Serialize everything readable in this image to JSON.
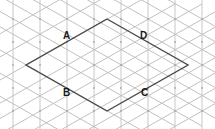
{
  "figure": {
    "title": "",
    "type": "geometry-diagram",
    "canvas": {
      "width": 215,
      "height": 129
    },
    "background_color": "#ffffff",
    "grid": {
      "kind": "triangular-isometric-grid",
      "vertical_line_color": "#c8c8c8",
      "diagonal_line_color": "#c0c0c0",
      "node_dot_color": "#a8a8a8",
      "vertical_spacing_px": 27,
      "row_spacing_px": 23,
      "vertical_x_positions": [
        13,
        40,
        67,
        94,
        121,
        148,
        175,
        202
      ],
      "row_y_positions": [
        -4,
        19,
        42,
        65,
        88,
        111,
        134
      ]
    },
    "shape": {
      "name": "rhombus",
      "stroke_color": "#4a4a4a",
      "stroke_width_px": 1.4,
      "fill": "none",
      "vertices": [
        {
          "id": "top",
          "x": 107,
          "y": 19
        },
        {
          "id": "right",
          "x": 188,
          "y": 65
        },
        {
          "id": "bottom",
          "x": 107,
          "y": 111
        },
        {
          "id": "left",
          "x": 26,
          "y": 65
        }
      ]
    },
    "labels": [
      {
        "id": "A",
        "text": "A",
        "x": 63,
        "y": 31,
        "edge": "top-left"
      },
      {
        "id": "D",
        "text": "D",
        "x": 140,
        "y": 31,
        "edge": "top-right"
      },
      {
        "id": "B",
        "text": "B",
        "x": 63,
        "y": 88,
        "edge": "bottom-left"
      },
      {
        "id": "C",
        "text": "C",
        "x": 141,
        "y": 88,
        "edge": "bottom-right"
      }
    ]
  }
}
